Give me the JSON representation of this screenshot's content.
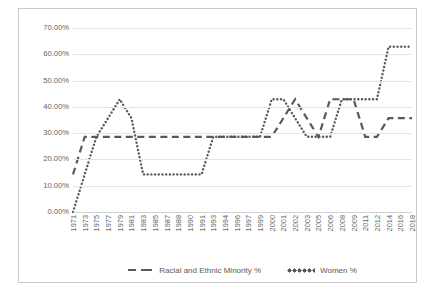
{
  "chart_data": {
    "type": "line",
    "title": "",
    "subtitle": "",
    "xlabel": "",
    "ylabel": "",
    "ylim": [
      0,
      70
    ],
    "ytick_labels": [
      "0.00%",
      "10.00%",
      "20.00%",
      "30.00%",
      "40.00%",
      "50.00%",
      "60.00%",
      "70.00%"
    ],
    "ytick_values": [
      0,
      10,
      20,
      30,
      40,
      50,
      60,
      70
    ],
    "grid": true,
    "legend_position": "bottom",
    "categories": [
      "1971",
      "1973",
      "1975",
      "1977",
      "1979",
      "1981",
      "1983",
      "1985",
      "1987",
      "1988",
      "1990",
      "1991",
      "1993",
      "1994",
      "1996",
      "1997",
      "1999",
      "2000",
      "2001",
      "2002",
      "2003",
      "2005",
      "2006",
      "2008",
      "2009",
      "2011",
      "2012",
      "2014",
      "2016",
      "2018"
    ],
    "series": [
      {
        "name": "Racial and Ethnic Minority %",
        "style": "dashed",
        "color": "#595959",
        "values": [
          14.3,
          28.6,
          28.6,
          28.6,
          28.6,
          28.6,
          28.6,
          28.6,
          28.6,
          28.6,
          28.6,
          28.6,
          28.6,
          28.6,
          28.6,
          28.6,
          28.6,
          28.6,
          35.7,
          42.9,
          35.7,
          28.6,
          42.9,
          42.9,
          42.9,
          28.6,
          28.6,
          35.7,
          35.7,
          35.7
        ]
      },
      {
        "name": "Women %",
        "style": "dotted",
        "color": "#595959",
        "values": [
          0.0,
          14.3,
          28.6,
          35.7,
          42.9,
          35.7,
          14.3,
          14.3,
          14.3,
          14.3,
          14.3,
          14.3,
          28.6,
          28.6,
          28.6,
          28.6,
          28.6,
          42.9,
          42.9,
          35.7,
          28.6,
          28.6,
          28.6,
          42.9,
          42.9,
          42.9,
          42.9,
          62.9,
          62.9,
          62.9
        ]
      }
    ]
  },
  "legend": {
    "items": [
      {
        "label": "Racial and Ethnic Minority %",
        "marker": "dashed-line-swatch"
      },
      {
        "label": "Women %",
        "marker": "dotted-line-swatch"
      }
    ]
  }
}
